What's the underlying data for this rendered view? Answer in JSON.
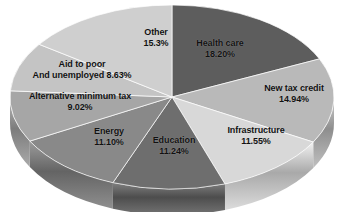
{
  "chart_data": {
    "type": "pie",
    "title": "",
    "subtitle": "",
    "xlabel": "",
    "ylabel": "",
    "legend_position": "none",
    "grid": false,
    "three_d": true,
    "start_angle_deg": 0,
    "direction": "clockwise",
    "units": "percent",
    "categories": [
      "Health care",
      "New tax credit",
      "Infrastructure",
      "Education",
      "Energy",
      "Alternative minimum tax",
      "Aid to poor And unemployed",
      "Other"
    ],
    "values": [
      18.2,
      14.94,
      11.55,
      11.24,
      11.1,
      9.02,
      8.63,
      15.3
    ],
    "value_labels": [
      "18.20%",
      "14.94%",
      "11.55%",
      "11.24%",
      "11.10%",
      "9.02%",
      "8.63%",
      "15.3%"
    ],
    "slice_colors": [
      "#5d5d5d",
      "#b9b9b9",
      "#d8d8d8",
      "#6e6e6e",
      "#898989",
      "#a6a6a6",
      "#c4c4c4",
      "#cfcfcf"
    ]
  },
  "slices": [
    {
      "name": "Health care",
      "value_label": "18.20%",
      "color": "#5d5d5d",
      "side_color": "#4b4b4b",
      "label_line1": "Health care",
      "label_line2": "18.20%"
    },
    {
      "name": "New tax credit",
      "value_label": "14.94%",
      "color": "#b9b9b9",
      "side_color": "#9a9a9a",
      "label_line1": "New tax credit",
      "label_line2": "14.94%"
    },
    {
      "name": "Infrastructure",
      "value_label": "11.55%",
      "color": "#d8d8d8",
      "side_color": "#b4b4b4",
      "label_line1": "Infrastructure",
      "label_line2": "11.55%"
    },
    {
      "name": "Education",
      "value_label": "11.24%",
      "color": "#6e6e6e",
      "side_color": "#5a5a5a",
      "label_line1": "Education",
      "label_line2": "11.24%"
    },
    {
      "name": "Energy",
      "value_label": "11.10%",
      "color": "#898989",
      "side_color": "#727272",
      "label_line1": "Energy",
      "label_line2": "11.10%"
    },
    {
      "name": "Alternative minimum tax",
      "value_label": "9.02%",
      "color": "#a6a6a6",
      "side_color": "#8b8b8b",
      "label_line1": "Alternative minimum tax",
      "label_line2": "9.02%"
    },
    {
      "name": "Aid to poor And unemployed",
      "value_label": "8.63%",
      "color": "#c4c4c4",
      "side_color": "#a3a3a3",
      "label_line1": "Aid to poor",
      "label_line2": "And unemployed 8.63%"
    },
    {
      "name": "Other",
      "value_label": "15.3%",
      "color": "#cfcfcf",
      "side_color": "#acacac",
      "label_line1": "Other",
      "label_line2": "15.3%"
    }
  ]
}
